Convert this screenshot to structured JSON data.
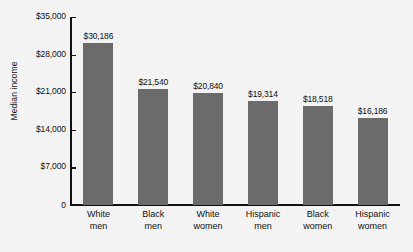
{
  "chart_data": {
    "type": "bar",
    "title": "",
    "xlabel": "",
    "ylabel": "Median income",
    "ylim": [
      0,
      35000
    ],
    "grid": false,
    "legend": "none",
    "ytick_labels": [
      "$35,000",
      "$28,000",
      "$21,000",
      "$14,000",
      "$7,000",
      "0"
    ],
    "ytick_values": [
      35000,
      28000,
      21000,
      14000,
      7000,
      0
    ],
    "categories": [
      "White men",
      "Black men",
      "White women",
      "Hispanic men",
      "Black women",
      "Hispanic women"
    ],
    "category_lines": [
      {
        "line1": "White",
        "line2": "men"
      },
      {
        "line1": "Black",
        "line2": "men"
      },
      {
        "line1": "White",
        "line2": "women"
      },
      {
        "line1": "Hispanic",
        "line2": "men"
      },
      {
        "line1": "Black",
        "line2": "women"
      },
      {
        "line1": "Hispanic",
        "line2": "women"
      }
    ],
    "values": [
      30186,
      21540,
      20840,
      19314,
      18518,
      16186
    ],
    "value_labels": [
      "$30,186",
      "$21,540",
      "$20,840",
      "$19,314",
      "$18,518",
      "$16,186"
    ],
    "bar_color": "#6b6b6b",
    "axis_color": "#111111",
    "background_color": "#f3f3f3"
  },
  "caption": {
    "top_cut_text": ""
  }
}
